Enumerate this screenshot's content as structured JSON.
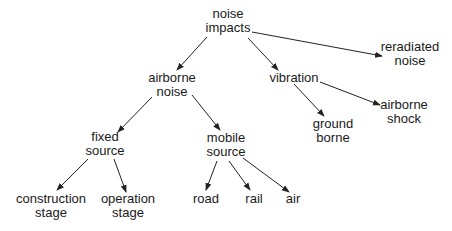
{
  "diagram": {
    "type": "tree",
    "nodes": {
      "root": {
        "line1": "noise",
        "line2": "impacts"
      },
      "airborne_noise": {
        "line1": "airborne",
        "line2": "noise"
      },
      "vibration": {
        "line1": "vibration",
        "line2": ""
      },
      "reradiated_noise": {
        "line1": "reradiated",
        "line2": "noise"
      },
      "fixed_source": {
        "line1": "fixed",
        "line2": "source"
      },
      "mobile_source": {
        "line1": "mobile",
        "line2": "source"
      },
      "ground_borne": {
        "line1": "ground",
        "line2": "borne"
      },
      "airborne_shock": {
        "line1": "airborne",
        "line2": "shock"
      },
      "construction_stage": {
        "line1": "construction",
        "line2": "stage"
      },
      "operation_stage": {
        "line1": "operation",
        "line2": "stage"
      },
      "road": {
        "line1": "road",
        "line2": ""
      },
      "rail": {
        "line1": "rail",
        "line2": ""
      },
      "air": {
        "line1": "air",
        "line2": ""
      }
    },
    "edges": [
      [
        "root",
        "airborne_noise"
      ],
      [
        "root",
        "vibration"
      ],
      [
        "root",
        "reradiated_noise"
      ],
      [
        "airborne_noise",
        "fixed_source"
      ],
      [
        "airborne_noise",
        "mobile_source"
      ],
      [
        "vibration",
        "ground_borne"
      ],
      [
        "vibration",
        "airborne_shock"
      ],
      [
        "fixed_source",
        "construction_stage"
      ],
      [
        "fixed_source",
        "operation_stage"
      ],
      [
        "mobile_source",
        "road"
      ],
      [
        "mobile_source",
        "rail"
      ],
      [
        "mobile_source",
        "air"
      ]
    ],
    "line_color": "#222222"
  }
}
